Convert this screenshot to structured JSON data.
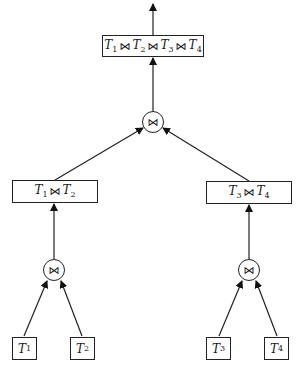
{
  "diagram": {
    "type": "join-tree",
    "join_symbol": "⋈",
    "root": {
      "label_parts": [
        {
          "rel": "T",
          "sub": "1"
        },
        {
          "rel": "T",
          "sub": "2"
        },
        {
          "rel": "T",
          "sub": "3"
        },
        {
          "rel": "T",
          "sub": "4"
        }
      ]
    },
    "intermediate": {
      "left": {
        "label_parts": [
          {
            "rel": "T",
            "sub": "1"
          },
          {
            "rel": "T",
            "sub": "2"
          }
        ]
      },
      "right": {
        "label_parts": [
          {
            "rel": "T",
            "sub": "3"
          },
          {
            "rel": "T",
            "sub": "4"
          }
        ]
      }
    },
    "leaves": [
      {
        "rel": "T",
        "sub": "1"
      },
      {
        "rel": "T",
        "sub": "2"
      },
      {
        "rel": "T",
        "sub": "3"
      },
      {
        "rel": "T",
        "sub": "4"
      }
    ],
    "join_nodes": [
      "⋈",
      "⋈",
      "⋈"
    ]
  }
}
